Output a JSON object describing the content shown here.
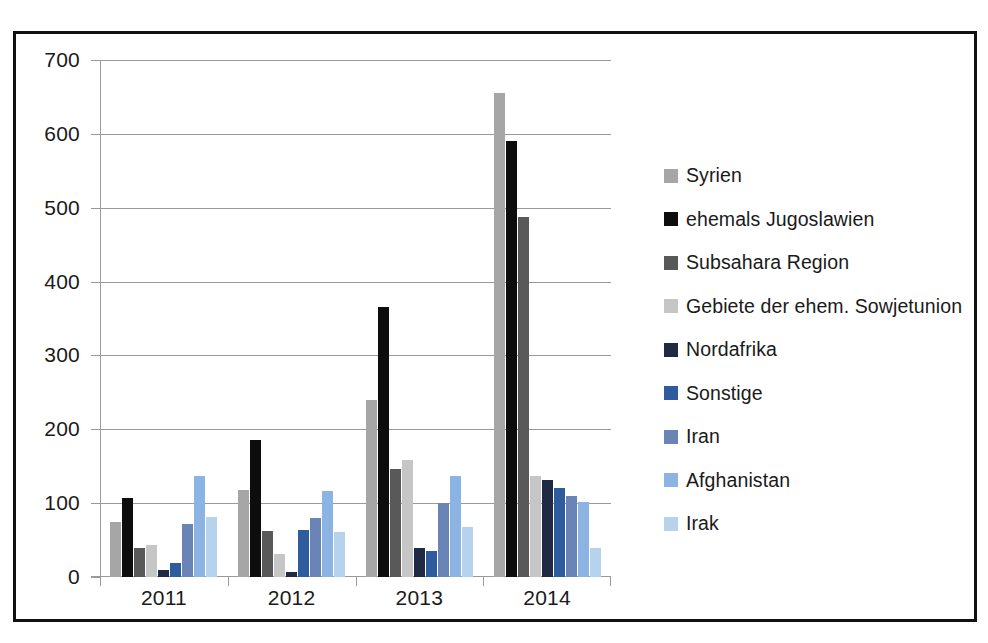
{
  "chart_data": {
    "type": "bar",
    "title": "",
    "subtitle": "",
    "xlabel": "",
    "ylabel": "",
    "categories": [
      "2011",
      "2012",
      "2013",
      "2014"
    ],
    "ylim": [
      0,
      700
    ],
    "yticks": [
      0,
      100,
      200,
      300,
      400,
      500,
      600,
      700
    ],
    "grid": true,
    "legend_position": "right",
    "series": [
      {
        "name": "Syrien",
        "color": "#a6a6a6",
        "values": [
          74,
          118,
          239,
          655
        ]
      },
      {
        "name": "ehemals Jugoslawien",
        "color": "#0d0d0d",
        "values": [
          107,
          186,
          366,
          590
        ]
      },
      {
        "name": "Subsahara Region",
        "color": "#595959",
        "values": [
          39,
          62,
          146,
          487
        ]
      },
      {
        "name": "Gebiete der ehem. Sowjetunion",
        "color": "#c6c6c6",
        "values": [
          44,
          31,
          158,
          137
        ]
      },
      {
        "name": "Nordafrika",
        "color": "#1f2a44",
        "values": [
          10,
          7,
          39,
          132
        ]
      },
      {
        "name": "Sonstige",
        "color": "#2e5c9e",
        "values": [
          19,
          63,
          35,
          121
        ]
      },
      {
        "name": "Iran",
        "color": "#6a84b5",
        "values": [
          72,
          80,
          100,
          110
        ]
      },
      {
        "name": "Afghanistan",
        "color": "#8cb4e2",
        "values": [
          137,
          116,
          137,
          102
        ]
      },
      {
        "name": "Irak",
        "color": "#b7d2ec",
        "values": [
          81,
          61,
          68,
          39
        ]
      }
    ]
  },
  "axis": {
    "y_tick_labels": [
      "700",
      "600",
      "500",
      "400",
      "300",
      "200",
      "100",
      "0"
    ],
    "x_tick_labels": [
      "2011",
      "2012",
      "2013",
      "2014"
    ]
  },
  "legend": {
    "items": [
      {
        "label": "Syrien"
      },
      {
        "label": "ehemals Jugoslawien"
      },
      {
        "label": "Subsahara Region"
      },
      {
        "label": "Gebiete der ehem. Sowjetunion"
      },
      {
        "label": "Nordafrika"
      },
      {
        "label": "Sonstige"
      },
      {
        "label": "Iran"
      },
      {
        "label": "Afghanistan"
      },
      {
        "label": "Irak"
      }
    ]
  },
  "colors": {
    "frame": "#111111",
    "grid": "#9a9a9a",
    "text": "#1a1a1a",
    "background": "#ffffff"
  }
}
